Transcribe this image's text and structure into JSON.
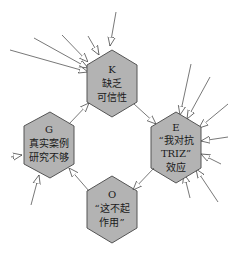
{
  "diagram": {
    "colors": {
      "node_fill": "#b3b3b3",
      "node_stroke": "#555555",
      "edge": "#555555",
      "arrow_head_fill": "#ffffff"
    },
    "nodes": [
      {
        "id": "K",
        "lines": [
          "缺乏",
          "可信性"
        ],
        "cx": 112,
        "cy": 80
      },
      {
        "id": "E",
        "lines": [
          "“我对抗",
          "TRIZ”",
          "效应"
        ],
        "cx": 176,
        "cy": 145
      },
      {
        "id": "O",
        "lines": [
          "“这不起",
          "作用”"
        ],
        "cx": 112,
        "cy": 208
      },
      {
        "id": "G",
        "lines": [
          "真实案例",
          "研究不够"
        ],
        "cx": 48,
        "cy": 145
      }
    ],
    "cycle_edges": [
      {
        "from": "K",
        "to": "E"
      },
      {
        "from": "E",
        "to": "O"
      },
      {
        "from": "O",
        "to": "G"
      },
      {
        "from": "G",
        "to": "K"
      }
    ],
    "incoming_arrow_counts": {
      "K": 5,
      "E": 7,
      "O": 0,
      "G": 2
    }
  }
}
